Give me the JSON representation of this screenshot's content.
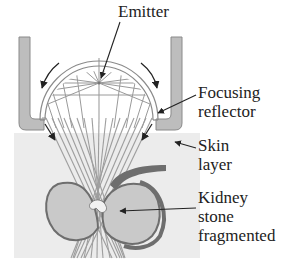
{
  "diagram": {
    "labels": {
      "emitter": "Emitter",
      "focusing_reflector_line1": "Focusing",
      "focusing_reflector_line2": "reflector",
      "skin_layer_line1": "Skin",
      "skin_layer_line2": "layer",
      "kidney_stone_line1": "Kidney",
      "kidney_stone_line2": "stone",
      "kidney_stone_line3": "fragmented"
    },
    "components": [
      {
        "id": "emitter",
        "description": "focal point inside reflector dome"
      },
      {
        "id": "focusing-reflector",
        "description": "semicircular dome reflector"
      },
      {
        "id": "housing-brackets",
        "description": "left and right L-shaped gray brackets"
      },
      {
        "id": "skin-layer",
        "description": "light gray tissue region"
      },
      {
        "id": "kidney",
        "description": "kidney cross-section with stone at focal point"
      },
      {
        "id": "shock-wave-beams",
        "description": "converging rays passing through focus"
      }
    ],
    "colors": {
      "bracket_fill": "#bdbdbd",
      "bracket_stroke": "#8a8a8a",
      "skin_fill": "#ececec",
      "kidney_fill": "#c9c9c9",
      "kidney_wall": "#6e6e6e",
      "beam": "#9a9a9a",
      "arrow": "#222222",
      "text": "#222222"
    }
  }
}
